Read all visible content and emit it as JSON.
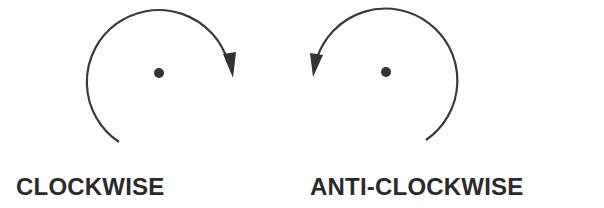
{
  "diagram": {
    "colors": {
      "stroke": "#3a3a3a",
      "text": "#2a2a2a",
      "background": "#ffffff"
    },
    "rotations": [
      {
        "id": "clockwise",
        "label": "CLOCKWISE",
        "direction": "clockwise",
        "arrow_position": "right"
      },
      {
        "id": "anticlockwise",
        "label": "ANTI-CLOCKWISE",
        "direction": "counterclockwise",
        "arrow_position": "left"
      }
    ]
  }
}
